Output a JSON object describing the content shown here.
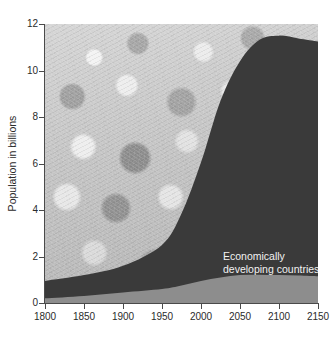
{
  "chart_data": {
    "type": "area",
    "title": "",
    "subtitle": "",
    "xlabel": "",
    "ylabel": "Population in billions",
    "xlim": [
      1800,
      2150
    ],
    "ylim": [
      0,
      12
    ],
    "grid": false,
    "stacked": true,
    "legend_position": "inside-annotations",
    "background": "photograph of a crowd of people (grayscale)",
    "x_ticks": [
      1800,
      1850,
      1900,
      1950,
      2000,
      2050,
      2100,
      2150
    ],
    "y_ticks": [
      0,
      2,
      4,
      6,
      8,
      10,
      12
    ],
    "x": [
      1800,
      1850,
      1900,
      1950,
      1975,
      2000,
      2025,
      2050,
      2075,
      2100,
      2125,
      2150
    ],
    "series": [
      {
        "name": "Industrialized countries",
        "color": "#8d8d8d",
        "values": [
          0.2,
          0.3,
          0.45,
          0.6,
          0.75,
          0.95,
          1.1,
          1.2,
          1.22,
          1.2,
          1.18,
          1.15
        ]
      },
      {
        "name": "Economically developing countries",
        "color": "#3a3a3a",
        "values": [
          0.75,
          0.9,
          1.15,
          1.9,
          3.1,
          5.1,
          7.6,
          9.2,
          10.1,
          10.3,
          10.2,
          10.1
        ]
      }
    ],
    "totals": [
      0.95,
      1.2,
      1.6,
      2.5,
      3.85,
      6.05,
      8.7,
      10.4,
      11.32,
      11.5,
      11.38,
      11.25
    ],
    "annotations": [
      {
        "text": "Economically\ndeveloping countries",
        "x": 2025,
        "y": 3.2
      },
      {
        "text": "Industrialized countries",
        "x": 2055,
        "y": 0.95
      }
    ]
  },
  "axis": {
    "y_title": "Population in billions",
    "y_ticks": [
      "12",
      "10",
      "8",
      "6",
      "4",
      "2",
      "0"
    ],
    "x_ticks": [
      "1800",
      "1850",
      "1900",
      "1950",
      "2000",
      "2050",
      "2100",
      "2150"
    ]
  },
  "annotations": {
    "developing_line1": "Economically",
    "developing_line2": "developing countries",
    "industrialized": "Industrialized countries"
  },
  "colors": {
    "developing_fill": "#3a3a3a",
    "industrialized_fill": "#8d8d8d",
    "axis": "#4a4a4a",
    "tick_text": "#2b2b2b",
    "annotation_text": "#f2f2f2",
    "plot_background": "#c9c9c9",
    "page_background": "#ffffff"
  }
}
